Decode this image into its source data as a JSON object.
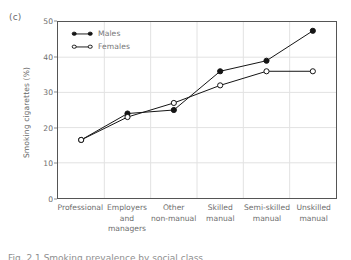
{
  "figure": {
    "panel_label": "(c)",
    "caption_fragment": "Fig. 2.1 Smoking prevalence by social class"
  },
  "legend": {
    "position": "top-left-inside",
    "entries": [
      {
        "label": "Males",
        "marker": "filled-circle"
      },
      {
        "label": "Females",
        "marker": "open-circle"
      }
    ]
  },
  "chart_data": {
    "type": "line",
    "title": "",
    "xlabel": "",
    "ylabel": "Smoking cigarettes (%)",
    "ylim": [
      0,
      50
    ],
    "yticks": [
      0,
      10,
      20,
      30,
      40,
      50
    ],
    "ytick_labels": [
      "0",
      "10",
      "20",
      "30",
      "40",
      "50"
    ],
    "grid": true,
    "categories": [
      "Professional",
      "Employers and managers",
      "Other non-manual",
      "Skilled manual",
      "Semi-skilled manual",
      "Unskilled manual"
    ],
    "category_label_lines": [
      [
        "Professional"
      ],
      [
        "Employers",
        "and",
        "managers"
      ],
      [
        "Other",
        "non-manual"
      ],
      [
        "Skilled",
        "manual"
      ],
      [
        "Semi-skilled",
        "manual"
      ],
      [
        "Unskilled",
        "manual"
      ]
    ],
    "series": [
      {
        "name": "Males",
        "marker": "filled-circle",
        "color": "#151515",
        "values": [
          16.5,
          24,
          25,
          36,
          39,
          47.5
        ]
      },
      {
        "name": "Females",
        "marker": "open-circle",
        "color": "#151515",
        "values": [
          16.5,
          23,
          27,
          32,
          36,
          36
        ]
      }
    ]
  },
  "colors": {
    "line": "#151515",
    "frame": "#555555",
    "grid": "#e2e2e2",
    "text": "#6d6d6d",
    "background": "#ffffff"
  }
}
